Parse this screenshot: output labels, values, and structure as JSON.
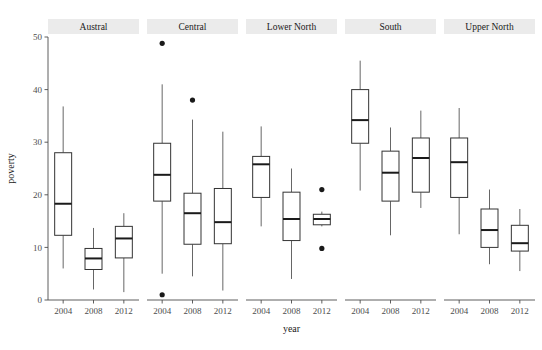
{
  "chart_data": {
    "type": "box",
    "title": "",
    "xlabel": "year",
    "ylabel": "poverty",
    "ylim": [
      0,
      50
    ],
    "yticks": [
      0,
      10,
      20,
      30,
      40,
      50
    ],
    "ytick_labels": [
      "0",
      "10",
      "20",
      "30",
      "40",
      "50"
    ],
    "grid": false,
    "legend": "none",
    "categories": [
      "2004",
      "2008",
      "2012"
    ],
    "panel_variable": "region",
    "panels": [
      {
        "label": "Austral",
        "boxes": [
          {
            "x": "2004",
            "min": 6.0,
            "q1": 12.3,
            "median": 18.3,
            "q3": 28.0,
            "max": 36.8,
            "outliers": []
          },
          {
            "x": "2008",
            "min": 2.0,
            "q1": 5.8,
            "median": 7.9,
            "q3": 9.8,
            "max": 13.7,
            "outliers": []
          },
          {
            "x": "2012",
            "min": 1.5,
            "q1": 8.0,
            "median": 11.7,
            "q3": 14.0,
            "max": 16.5,
            "outliers": []
          }
        ]
      },
      {
        "label": "Central",
        "boxes": [
          {
            "x": "2004",
            "min": 5.0,
            "q1": 18.8,
            "median": 23.8,
            "q3": 29.8,
            "max": 41.0,
            "outliers": [
              48.8,
              1.0
            ]
          },
          {
            "x": "2008",
            "min": 4.5,
            "q1": 10.6,
            "median": 16.5,
            "q3": 20.3,
            "max": 34.3,
            "outliers": [
              38.0
            ]
          },
          {
            "x": "2012",
            "min": 1.8,
            "q1": 10.7,
            "median": 14.8,
            "q3": 21.2,
            "max": 32.0,
            "outliers": []
          }
        ]
      },
      {
        "label": "Lower North",
        "boxes": [
          {
            "x": "2004",
            "min": 14.0,
            "q1": 19.5,
            "median": 25.8,
            "q3": 27.3,
            "max": 33.0,
            "outliers": []
          },
          {
            "x": "2008",
            "min": 4.0,
            "q1": 11.3,
            "median": 15.4,
            "q3": 20.5,
            "max": 25.0,
            "outliers": []
          },
          {
            "x": "2012",
            "min": 14.0,
            "q1": 14.3,
            "median": 15.4,
            "q3": 16.3,
            "max": 16.8,
            "outliers": [
              21.0,
              9.8
            ]
          }
        ]
      },
      {
        "label": "South",
        "boxes": [
          {
            "x": "2004",
            "min": 20.8,
            "q1": 29.8,
            "median": 34.2,
            "q3": 40.0,
            "max": 45.5,
            "outliers": []
          },
          {
            "x": "2008",
            "min": 12.3,
            "q1": 18.8,
            "median": 24.2,
            "q3": 28.3,
            "max": 32.8,
            "outliers": []
          },
          {
            "x": "2012",
            "min": 17.5,
            "q1": 20.5,
            "median": 27.0,
            "q3": 30.8,
            "max": 36.0,
            "outliers": []
          }
        ]
      },
      {
        "label": "Upper North",
        "boxes": [
          {
            "x": "2004",
            "min": 12.5,
            "q1": 19.5,
            "median": 26.2,
            "q3": 30.8,
            "max": 36.5,
            "outliers": []
          },
          {
            "x": "2008",
            "min": 6.8,
            "q1": 10.0,
            "median": 13.3,
            "q3": 17.3,
            "max": 21.0,
            "outliers": []
          },
          {
            "x": "2012",
            "min": 5.5,
            "q1": 9.3,
            "median": 10.8,
            "q3": 14.2,
            "max": 17.3,
            "outliers": []
          }
        ]
      }
    ],
    "colors": {
      "box_stroke": "#333333",
      "box_fill": "#ffffff",
      "median_stroke": "#1a1a1a",
      "whisker_stroke": "#555555",
      "outlier_fill": "#1a1a1a",
      "axis_line": "#4d4d4d",
      "strip_background": "#ebebeb",
      "panel_background": "#ffffff",
      "text": "#1a1a1a"
    }
  }
}
